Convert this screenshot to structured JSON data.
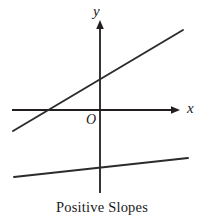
{
  "figure": {
    "caption": "Positive Slopes",
    "background_color": "#ffffff",
    "line_color": "#2b2b2b",
    "axis_color": "#231f20",
    "width": 204,
    "height": 224
  },
  "axes": {
    "y_axis_label": "y",
    "x_axis_label": "x",
    "origin_label": "O",
    "x_axis": {
      "x_start": 12,
      "x_end": 180,
      "y": 110,
      "has_arrow": true,
      "arrow_end": "right"
    },
    "y_axis": {
      "y_start": 20,
      "y_end": 193,
      "x": 100,
      "has_arrow": true,
      "arrow_end": "top"
    }
  },
  "chart_data": {
    "type": "line",
    "title": "Positive Slopes",
    "xlabel": "x",
    "ylabel": "y",
    "grid": false,
    "legend": null,
    "origin_label": "O",
    "origin_px": {
      "x": 100,
      "y": 110
    },
    "axis_arrows": {
      "x": "right",
      "y": "up"
    },
    "xlim_px": [
      12,
      180
    ],
    "ylim_px": [
      20,
      193
    ],
    "annotations": [
      "Positive Slopes"
    ],
    "series": [
      {
        "name": "upper-line",
        "description": "steeper positive slope line crossing both axes",
        "points_px": [
          [
            13,
            131
          ],
          [
            183,
            30
          ]
        ],
        "slope_sign": "positive",
        "slope_px": -0.594,
        "y_intercept_px": 80,
        "x_intercept_px": 47
      },
      {
        "name": "lower-line",
        "description": "shallow positive slope line below the x-axis",
        "points_px": [
          [
            14,
            177
          ],
          [
            188,
            158
          ]
        ],
        "slope_sign": "positive",
        "slope_px": -0.109,
        "y_intercept_px": 168,
        "x_intercept_px": null
      }
    ]
  }
}
